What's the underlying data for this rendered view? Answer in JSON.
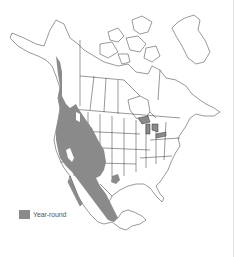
{
  "map": {
    "region": "North America",
    "range_color": "#8a8a8a",
    "border_color": "#333333",
    "background": "#ffffff"
  },
  "legend": {
    "items": [
      {
        "label": "Year-round",
        "color": "#8a8a8a"
      }
    ]
  }
}
